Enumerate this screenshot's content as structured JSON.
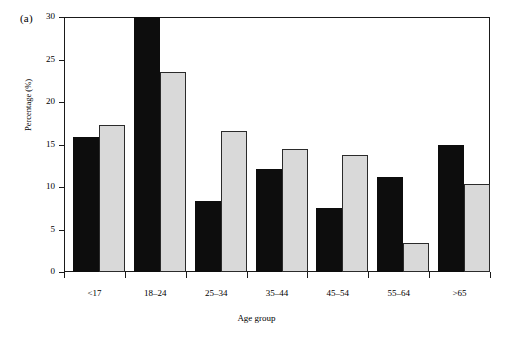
{
  "figure": {
    "panel_label": "(a)"
  },
  "chart_data": {
    "type": "bar",
    "title": "",
    "xlabel": "Age group",
    "ylabel": "Percentage (%)",
    "categories": [
      "<17",
      "18–24",
      "25–34",
      "35–44",
      "45–54",
      "55–64",
      ">65"
    ],
    "series": [
      {
        "name": "series-1",
        "color": "#0d0d0d",
        "values": [
          15.9,
          30.0,
          8.4,
          12.1,
          7.5,
          11.2,
          14.9
        ]
      },
      {
        "name": "series-2",
        "color": "#d9d9d9",
        "values": [
          17.3,
          23.5,
          16.6,
          14.5,
          13.8,
          3.4,
          10.4
        ]
      }
    ],
    "ylim": [
      0,
      30
    ],
    "yticks": [
      0,
      5,
      10,
      15,
      20,
      25,
      30
    ],
    "ytick_labels": [
      "0",
      "5",
      "10",
      "15",
      "20",
      "25",
      "30"
    ],
    "grid": false,
    "legend": "none"
  }
}
